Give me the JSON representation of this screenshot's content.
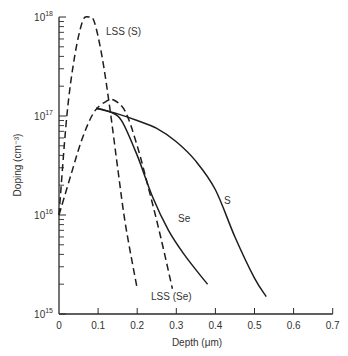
{
  "chart_data": {
    "type": "line",
    "title": "",
    "xlabel": "Depth (μm)",
    "ylabel": "Doping (cm⁻³)",
    "xlim": [
      0,
      0.7
    ],
    "ylim": [
      1000000000000000.0,
      1e+18
    ],
    "yscale": "log",
    "grid": false,
    "legend": "inline curve labels",
    "x_ticks": [
      "0",
      "0.1",
      "0.2",
      "0.3",
      "0.4",
      "0.5",
      "0.6",
      "0.7"
    ],
    "y_ticks": [
      {
        "base": "10",
        "exp": "15"
      },
      {
        "base": "10",
        "exp": "16"
      },
      {
        "base": "10",
        "exp": "17"
      },
      {
        "base": "10",
        "exp": "18"
      }
    ],
    "series": [
      {
        "name": "LSS (S)",
        "style": "dashed",
        "label": "LSS (S)",
        "points": [
          [
            0.0,
            1e+16
          ],
          [
            0.02,
            1e+17
          ],
          [
            0.04,
            4e+17
          ],
          [
            0.06,
            9e+17
          ],
          [
            0.075,
            1e+18
          ],
          [
            0.09,
            9e+17
          ],
          [
            0.11,
            4e+17
          ],
          [
            0.13,
            1.2e+17
          ],
          [
            0.15,
            3e+16
          ],
          [
            0.17,
            8000000000000000.0
          ],
          [
            0.2,
            1800000000000000.0
          ]
        ]
      },
      {
        "name": "LSS (Se)",
        "style": "dashed",
        "label": "LSS (Se)",
        "points": [
          [
            0.0,
            1e+16
          ],
          [
            0.03,
            2.5e+16
          ],
          [
            0.06,
            6e+16
          ],
          [
            0.09,
            1.1e+17
          ],
          [
            0.12,
            1.4e+17
          ],
          [
            0.14,
            1.45e+17
          ],
          [
            0.17,
            1.1e+17
          ],
          [
            0.2,
            5e+16
          ],
          [
            0.23,
            1.8e+16
          ],
          [
            0.26,
            6000000000000000.0
          ],
          [
            0.29,
            1800000000000000.0
          ]
        ]
      },
      {
        "name": "Se",
        "style": "solid",
        "label": "Se",
        "points": [
          [
            0.095,
            1.2e+17
          ],
          [
            0.13,
            1.1e+17
          ],
          [
            0.16,
            9e+16
          ],
          [
            0.2,
            4e+16
          ],
          [
            0.24,
            1.5e+16
          ],
          [
            0.28,
            7000000000000000.0
          ],
          [
            0.32,
            4000000000000000.0
          ],
          [
            0.36,
            2500000000000000.0
          ],
          [
            0.38,
            2000000000000000.0
          ]
        ]
      },
      {
        "name": "S",
        "style": "solid",
        "label": "S",
        "points": [
          [
            0.095,
            1.2e+17
          ],
          [
            0.15,
            1.05e+17
          ],
          [
            0.2,
            9e+16
          ],
          [
            0.25,
            7.5e+16
          ],
          [
            0.3,
            5.5e+16
          ],
          [
            0.35,
            3.5e+16
          ],
          [
            0.4,
            1.8e+16
          ],
          [
            0.45,
            6000000000000000.0
          ],
          [
            0.5,
            2300000000000000.0
          ],
          [
            0.53,
            1500000000000000.0
          ]
        ]
      }
    ]
  }
}
